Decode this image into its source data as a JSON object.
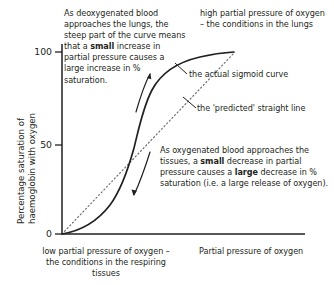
{
  "chart_data": {
    "type": "line",
    "title": "",
    "xlabel": "Partial pressure of oxygen",
    "ylabel": "Percentage saturation of haemoglobin with oxygen",
    "ylabel_line1": "Percentage saturation of",
    "ylabel_line2": "haemoglobin with oxygen",
    "yticks": [
      "0",
      "50",
      "100"
    ],
    "ylim": [
      0,
      100
    ],
    "xticks": [],
    "grid": false,
    "legend": "none",
    "series": [
      {
        "name": "the actual sigmoid curve",
        "style": "solid",
        "x": [
          0,
          5,
          10,
          15,
          20,
          25,
          30,
          35,
          40,
          45,
          50,
          55,
          60,
          65,
          70,
          75,
          80,
          85,
          90,
          95,
          100
        ],
        "y": [
          0,
          1,
          2.5,
          4.5,
          7,
          10,
          14,
          19,
          26,
          35,
          47,
          60,
          71,
          80,
          86.5,
          91,
          94,
          96,
          97.5,
          98.7,
          99.5
        ]
      },
      {
        "name": "the 'predicted' straight line",
        "style": "dotted",
        "x": [
          0,
          100
        ],
        "y": [
          0,
          100
        ]
      }
    ]
  },
  "annotations": {
    "lungs_steep": {
      "parts": [
        {
          "text": "As deoxygenated blood approaches the lungs, the steep part of the curve means that a ",
          "bold": false
        },
        {
          "text": "small",
          "bold": true
        },
        {
          "text": " increase in partial pressure causes a large increase in % saturation.",
          "bold": false
        }
      ]
    },
    "high_partial_pressure": {
      "text": "high partial pressure of oxygen  – the conditions in the lungs"
    },
    "sigmoid_curve_label": {
      "text": "the actual sigmoid curve"
    },
    "predicted_line_label": {
      "text": "the 'predicted' straight line"
    },
    "tissues_release": {
      "parts": [
        {
          "text": "As oxygenated blood approaches the tissues, a ",
          "bold": false
        },
        {
          "text": "small",
          "bold": true
        },
        {
          "text": " decrease in partial pressure causes a ",
          "bold": false
        },
        {
          "text": "large",
          "bold": true
        },
        {
          "text": " decrease in % saturation (i.e. a large release of oxygen).",
          "bold": false
        }
      ]
    },
    "low_partial_pressure": {
      "text": "low partial pressure of oxygen – the conditions in the respiring tissues"
    }
  },
  "colors": {
    "ink": "#231f20",
    "curve": "#231f20",
    "dotted": "#6f6f6f",
    "axis": "#231f20"
  }
}
